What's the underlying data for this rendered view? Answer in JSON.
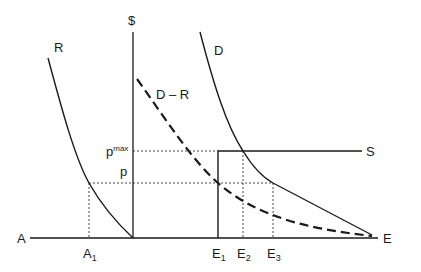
{
  "diagram": {
    "axes": {
      "y_label": "$",
      "x_left_label": "A",
      "x_right_label": "E"
    },
    "curves": {
      "R": {
        "label": "R",
        "style": "solid"
      },
      "D": {
        "label": "D",
        "style": "solid"
      },
      "D_minus_R": {
        "label": "D – R",
        "style": "dashed"
      },
      "S": {
        "label": "S",
        "style": "solid"
      }
    },
    "price_levels": {
      "pmax": {
        "base": "p",
        "sup": "max"
      },
      "p": {
        "base": "p"
      }
    },
    "x_markers": {
      "A1": {
        "base": "A",
        "sub": "1"
      },
      "E1": {
        "base": "E",
        "sub": "1"
      },
      "E2": {
        "base": "E",
        "sub": "2"
      },
      "E3": {
        "base": "E",
        "sub": "3"
      }
    },
    "colors": {
      "line": "#1a1a1a",
      "background": "#ffffff"
    }
  }
}
